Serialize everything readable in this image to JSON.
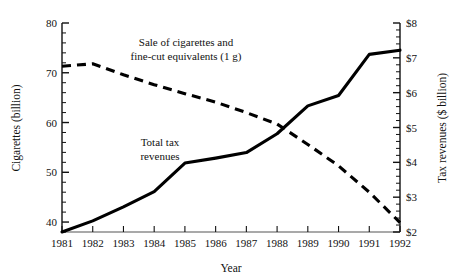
{
  "chart_data": {
    "type": "line",
    "title": "",
    "xlabel": "Year",
    "ylabel": "Cigarettes (billion)",
    "y2label": "Tax revenues ($ billion)",
    "x": [
      1981,
      1982,
      1983,
      1984,
      1985,
      1986,
      1987,
      1988,
      1989,
      1990,
      1991,
      1992
    ],
    "xtick_labels": [
      "1981",
      "1982",
      "1983",
      "1984",
      "1985",
      "1986",
      "1987",
      "1988",
      "1989",
      "1990",
      "1991",
      "1992"
    ],
    "xlim": [
      1981,
      1992
    ],
    "ylim": [
      38,
      80
    ],
    "ytick_labels": [
      "40",
      "50",
      "60",
      "70",
      "80"
    ],
    "ytick_values": [
      40,
      50,
      60,
      70,
      80
    ],
    "y2lim": [
      2,
      8
    ],
    "y2tick_labels": [
      "$2",
      "$3",
      "$4",
      "$5",
      "$6",
      "$7",
      "$8"
    ],
    "y2tick_values": [
      2,
      3,
      4,
      5,
      6,
      7,
      8
    ],
    "grid": false,
    "legend_position": "inline-annotations",
    "minor_ticks": true,
    "series": [
      {
        "name": "Sale of cigarettes and fine-cut equivalents (1 g)",
        "axis": "left",
        "style": "dashed",
        "color": "#000000",
        "values": [
          71.3,
          71.8,
          69.6,
          67.6,
          65.8,
          64.1,
          62.0,
          59.7,
          55.6,
          51.3,
          46.0,
          39.9
        ]
      },
      {
        "name": "Total tax revenues",
        "axis": "right",
        "style": "solid",
        "color": "#000000",
        "values": [
          2.0,
          2.32,
          2.72,
          3.16,
          3.98,
          4.12,
          4.28,
          4.82,
          5.62,
          5.92,
          7.1,
          7.22
        ]
      }
    ],
    "annotations": [
      {
        "name": "cigarette-sales-label",
        "lines": [
          "Sale of cigarettes and",
          "fine-cut equivalents (1 g)"
        ],
        "x_px": 186,
        "y_px": 46
      },
      {
        "name": "tax-revenues-label",
        "lines": [
          "Total tax",
          "revenues"
        ],
        "x_px": 160,
        "y_px": 146
      }
    ]
  }
}
